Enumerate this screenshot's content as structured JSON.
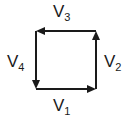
{
  "figure": {
    "type": "vector-loop-diagram",
    "background_color": "#ffffff",
    "stroke_color": "#1a1a1a",
    "label_color": "#1a1a1a",
    "shape": "square",
    "square": {
      "left": 36,
      "top": 31,
      "right": 96,
      "bottom": 89
    },
    "vectors": [
      {
        "id": "v1",
        "name": "V",
        "subscript": "1",
        "edge": "bottom",
        "direction": "right",
        "arrow_glyph": "→",
        "label_position": "below"
      },
      {
        "id": "v2",
        "name": "V",
        "subscript": "2",
        "edge": "right",
        "direction": "up",
        "arrow_glyph": "↑",
        "label_position": "right"
      },
      {
        "id": "v3",
        "name": "V",
        "subscript": "3",
        "edge": "top",
        "direction": "left",
        "arrow_glyph": "←",
        "label_position": "above"
      },
      {
        "id": "v4",
        "name": "V",
        "subscript": "4",
        "edge": "left",
        "direction": "down",
        "arrow_glyph": "↓",
        "label_position": "left"
      }
    ]
  }
}
